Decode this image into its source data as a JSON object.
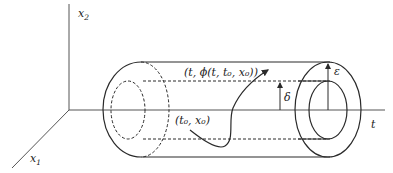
{
  "diagram": {
    "axes": {
      "x2": {
        "label": "x",
        "sub": "2"
      },
      "x1": {
        "label": "x",
        "sub": "1"
      },
      "t": {
        "label": "t"
      }
    },
    "labels": {
      "trajectory_end": "(t, ϕ(t, t₀, x₀))",
      "initial_point": "(t₀, x₀)",
      "epsilon": "ε",
      "delta": "δ"
    },
    "colors": {
      "stroke": "#2a2a2a",
      "axis": "#555555",
      "background": "#ffffff"
    }
  }
}
